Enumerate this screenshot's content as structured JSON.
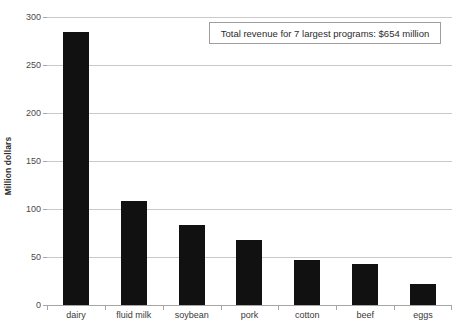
{
  "chart_data": {
    "type": "bar",
    "title": "",
    "xlabel": "",
    "ylabel": "Million dollars",
    "categories": [
      "dairy",
      "fluid milk",
      "soybean",
      "pork",
      "cotton",
      "beef",
      "eggs"
    ],
    "values": [
      284,
      108,
      83,
      68,
      47,
      43,
      22
    ],
    "ylim": [
      0,
      300
    ],
    "ytick_step": 50,
    "yticks": [
      "0",
      "50",
      "100",
      "150",
      "200",
      "250",
      "300"
    ],
    "grid": "horizontal",
    "legend": "none",
    "bar_color": "#111111",
    "gridline_color": "#c9c9c9",
    "axis_color": "#a6a6a6",
    "annotations": [
      {
        "name": "total-revenue-note",
        "text": "Total revenue for 7 largest programs: $654 million"
      }
    ]
  }
}
